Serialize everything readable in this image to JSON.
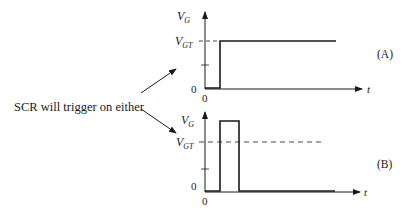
{
  "caption": "SCR will trigger on either",
  "panels": [
    {
      "id": "A",
      "tag": "(A)",
      "y_axis_label": "V",
      "y_axis_sub": "G",
      "threshold_label": "V",
      "threshold_sub": "GT",
      "y_zero_label": "0",
      "x_zero_label": "0",
      "x_axis_label": "t",
      "waveform": "step",
      "description": "Gate voltage steps up to V_GT and stays"
    },
    {
      "id": "B",
      "tag": "(B)",
      "y_axis_label": "V",
      "y_axis_sub": "G",
      "threshold_label": "V",
      "threshold_sub": "GT",
      "y_zero_label": "0",
      "x_zero_label": "0",
      "x_axis_label": "t",
      "waveform": "pulse",
      "description": "Short pulse exceeding V_GT, then returns to zero"
    }
  ],
  "colors": {
    "ink": "#1a1a1a",
    "background": "#ffffff"
  }
}
